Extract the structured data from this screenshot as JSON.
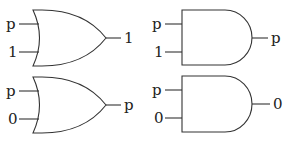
{
  "diagram": {
    "title": "",
    "colors": {
      "stroke": "#333333",
      "text": "#222222",
      "background": "#ffffff"
    },
    "gates": [
      {
        "id": "or-top",
        "type": "OR",
        "inputs": [
          "p",
          "1"
        ],
        "output": "1"
      },
      {
        "id": "and-top",
        "type": "AND",
        "inputs": [
          "p",
          "1"
        ],
        "output": "p"
      },
      {
        "id": "or-bottom",
        "type": "OR",
        "inputs": [
          "p",
          "0"
        ],
        "output": "p"
      },
      {
        "id": "and-bottom",
        "type": "AND",
        "inputs": [
          "p",
          "0"
        ],
        "output": "0"
      }
    ]
  }
}
